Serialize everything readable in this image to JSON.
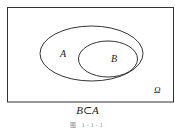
{
  "diagram": {
    "type": "venn",
    "universe_label": "Ω",
    "sets": [
      {
        "name": "A",
        "label": "A"
      },
      {
        "name": "B",
        "label": "B",
        "subset_of": "A"
      }
    ],
    "relation_caption": "B⊂A",
    "figure_caption": "图 1-1-1",
    "stroke_color": "#333333",
    "background_color": "#ffffff"
  }
}
